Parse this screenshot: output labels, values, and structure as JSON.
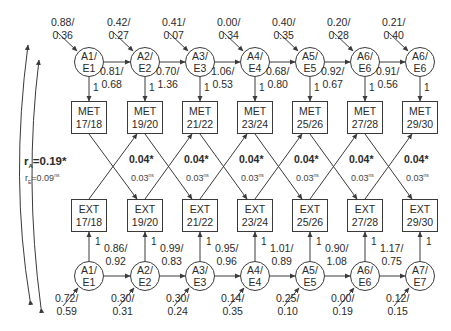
{
  "diagram": {
    "top_row": [
      {
        "id": "A1",
        "line1": "A1/",
        "line2": "E1",
        "input_a": "0.88/",
        "input_e": "0.36",
        "path_a": "0.81/",
        "path_e": "0.68",
        "loading": "1"
      },
      {
        "id": "A2",
        "line1": "A2/",
        "line2": "E2",
        "input_a": "0.42/",
        "input_e": "0.27",
        "path_a": "0.70/",
        "path_e": "1.36",
        "loading": "1"
      },
      {
        "id": "A3",
        "line1": "A3/",
        "line2": "E3",
        "input_a": "0.41/",
        "input_e": "0.07",
        "path_a": "1.06/",
        "path_e": "0.53",
        "loading": "1"
      },
      {
        "id": "A4",
        "line1": "A4/",
        "line2": "E4",
        "input_a": "0.00/",
        "input_e": "0.34",
        "path_a": "0.68/",
        "path_e": "0.80",
        "loading": "1"
      },
      {
        "id": "A5",
        "line1": "A5/",
        "line2": "E5",
        "input_a": "0.40/",
        "input_e": "0.35",
        "path_a": "0.92/",
        "path_e": "0.67",
        "loading": "1"
      },
      {
        "id": "A6",
        "line1": "A6/",
        "line2": "E6",
        "input_a": "0.20/",
        "input_e": "0.28",
        "path_a": "0.91/",
        "path_e": "0.56",
        "loading": "1"
      },
      {
        "id": "A6b",
        "line1": "A6/",
        "line2": "E6",
        "input_a": "0.21/",
        "input_e": "0.40",
        "loading": "1"
      }
    ],
    "met_boxes": [
      {
        "line1": "MET",
        "line2": "17/18"
      },
      {
        "line1": "MET",
        "line2": "19/20"
      },
      {
        "line1": "MET",
        "line2": "21/22"
      },
      {
        "line1": "MET",
        "line2": "23/24"
      },
      {
        "line1": "MET",
        "line2": "25/26"
      },
      {
        "line1": "MET",
        "line2": "27/28"
      },
      {
        "line1": "MET",
        "line2": "29/30"
      }
    ],
    "ext_boxes": [
      {
        "line1": "EXT",
        "line2": "17/18"
      },
      {
        "line1": "EXT",
        "line2": "19/20"
      },
      {
        "line1": "EXT",
        "line2": "21/22"
      },
      {
        "line1": "EXT",
        "line2": "23/24"
      },
      {
        "line1": "EXT",
        "line2": "25/26"
      },
      {
        "line1": "EXT",
        "line2": "27/28"
      },
      {
        "line1": "EXT",
        "line2": "29/30"
      }
    ],
    "correlations": {
      "rA_symbol": "r",
      "rA_sub": "A",
      "rA_value": "=0.19*",
      "rE_symbol": "r",
      "rE_sub": "E",
      "rE_value": "=0.09",
      "rE_sup": "ns",
      "cross_bold": [
        "0.04*",
        "0.04*",
        "0.04*",
        "0.04*",
        "0.04*",
        "0.04*"
      ],
      "cross_small": [
        "0.03",
        "0.03",
        "0.03",
        "0.03",
        "0.03",
        "0.03"
      ],
      "cross_small_sup": "ns"
    },
    "bottom_row": [
      {
        "id": "A1",
        "line1": "A1/",
        "line2": "E1",
        "input_a": "0.72/",
        "input_e": "0.59",
        "path_a": "0.86/",
        "path_e": "0.92",
        "loading": "1"
      },
      {
        "id": "A2",
        "line1": "A2/",
        "line2": "E2",
        "input_a": "0.30/",
        "input_e": "0.31",
        "path_a": "0.99/",
        "path_e": "0.83",
        "loading": "1"
      },
      {
        "id": "A3",
        "line1": "A3/",
        "line2": "E3",
        "input_a": "0.30/",
        "input_e": "0.24",
        "path_a": "0.95/",
        "path_e": "0.96",
        "loading": "1"
      },
      {
        "id": "A4",
        "line1": "A4/",
        "line2": "E4",
        "input_a": "0.14/",
        "input_e": "0.35",
        "path_a": "1.01/",
        "path_e": "0.89",
        "loading": "1"
      },
      {
        "id": "A5",
        "line1": "A5/",
        "line2": "E5",
        "input_a": "0.25/",
        "input_e": "0.10",
        "path_a": "0.90/",
        "path_e": "1.08",
        "loading": "1"
      },
      {
        "id": "A6",
        "line1": "A6/",
        "line2": "E6",
        "input_a": "0.00/",
        "input_e": "0.19",
        "path_a": "1.17/",
        "path_e": "0.75",
        "loading": "1"
      },
      {
        "id": "A7",
        "line1": "A7/",
        "line2": "E7",
        "input_a": "0.12/",
        "input_e": "0.15",
        "loading": "1"
      }
    ]
  },
  "colors": {
    "line": "#3a3a3a",
    "text": "#2a2a2a",
    "background": "#ffffff"
  }
}
